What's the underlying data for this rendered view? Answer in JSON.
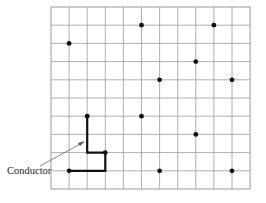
{
  "diagram": {
    "title": "",
    "grid": {
      "columns": 11,
      "rows": 10,
      "x0": 51,
      "y0": 7,
      "cell_w": 18.1,
      "cell_h": 18.2,
      "line_color": "#9a9a9a"
    },
    "pins": [
      {
        "col": 1,
        "row": 2
      },
      {
        "col": 5,
        "row": 1
      },
      {
        "col": 9,
        "row": 1
      },
      {
        "col": 8,
        "row": 3
      },
      {
        "col": 6,
        "row": 4
      },
      {
        "col": 10,
        "row": 4
      },
      {
        "col": 2,
        "row": 6
      },
      {
        "col": 5,
        "row": 6
      },
      {
        "col": 8,
        "row": 7
      },
      {
        "col": 3,
        "row": 8
      },
      {
        "col": 1,
        "row": 9
      },
      {
        "col": 6,
        "row": 9
      },
      {
        "col": 10,
        "row": 9
      }
    ],
    "conductor": {
      "label": "Conductor",
      "path": [
        {
          "col": 1,
          "row": 9
        },
        {
          "col": 3,
          "row": 9
        },
        {
          "col": 3,
          "row": 8
        },
        {
          "col": 2,
          "row": 8
        },
        {
          "col": 2,
          "row": 6
        }
      ],
      "color": "#111111"
    }
  }
}
